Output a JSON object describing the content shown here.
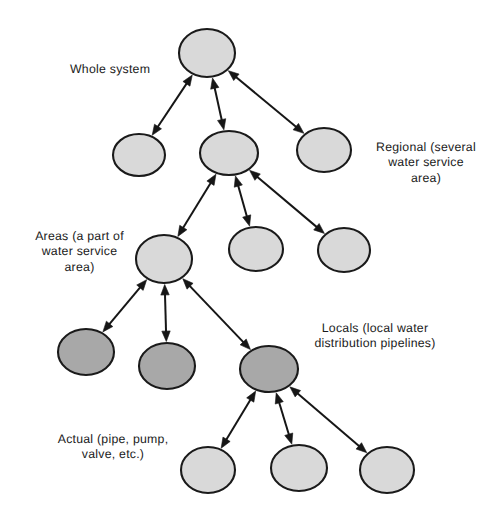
{
  "diagram": {
    "background_color": "#ffffff",
    "node_fill_light": "#d9d9d9",
    "node_fill_dark": "#a8a8a8",
    "node_stroke": "#1a1a1a",
    "edge_color": "#161616",
    "labels": [
      {
        "id": "whole-system",
        "text": "Whole system",
        "align": "left",
        "x": 70,
        "y": 62,
        "width": 100
      },
      {
        "id": "regional",
        "text": "Regional (several\nwater service\narea)",
        "align": "center",
        "x": 362,
        "y": 140,
        "width": 128
      },
      {
        "id": "areas",
        "text": "Areas (a part of\nwater service\narea)",
        "align": "center",
        "x": 17,
        "y": 229,
        "width": 125
      },
      {
        "id": "locals",
        "text": "Locals (local water\ndistribution pipelines)",
        "align": "center",
        "x": 297,
        "y": 321,
        "width": 156
      },
      {
        "id": "actual",
        "text": "Actual (pipe, pump,\nvalve, etc.)",
        "align": "center",
        "x": 37,
        "y": 432,
        "width": 152
      }
    ],
    "nodes": [
      {
        "id": "n-root",
        "level": 1,
        "shade": "light",
        "cx": 207,
        "cy": 53,
        "rx": 28,
        "ry": 24
      },
      {
        "id": "n-reg-left",
        "level": 2,
        "shade": "light",
        "cx": 139,
        "cy": 155,
        "rx": 26,
        "ry": 21
      },
      {
        "id": "n-reg-mid",
        "level": 2,
        "shade": "light",
        "cx": 229,
        "cy": 153,
        "rx": 29,
        "ry": 22
      },
      {
        "id": "n-reg-right",
        "level": 2,
        "shade": "light",
        "cx": 324,
        "cy": 150,
        "rx": 27,
        "ry": 22
      },
      {
        "id": "n-area-left",
        "level": 3,
        "shade": "light",
        "cx": 164,
        "cy": 259,
        "rx": 28,
        "ry": 24
      },
      {
        "id": "n-area-mid",
        "level": 3,
        "shade": "light",
        "cx": 256,
        "cy": 249,
        "rx": 27,
        "ry": 22
      },
      {
        "id": "n-area-right",
        "level": 3,
        "shade": "light",
        "cx": 344,
        "cy": 250,
        "rx": 26,
        "ry": 22
      },
      {
        "id": "n-local-1",
        "level": 4,
        "shade": "dark",
        "cx": 86,
        "cy": 352,
        "rx": 28,
        "ry": 23
      },
      {
        "id": "n-local-2",
        "level": 4,
        "shade": "dark",
        "cx": 167,
        "cy": 366,
        "rx": 28,
        "ry": 23
      },
      {
        "id": "n-local-3",
        "level": 4,
        "shade": "dark",
        "cx": 269,
        "cy": 369,
        "rx": 29,
        "ry": 23
      },
      {
        "id": "n-actual-1",
        "level": 5,
        "shade": "light",
        "cx": 208,
        "cy": 470,
        "rx": 27,
        "ry": 23
      },
      {
        "id": "n-actual-2",
        "level": 5,
        "shade": "light",
        "cx": 299,
        "cy": 468,
        "rx": 28,
        "ry": 23
      },
      {
        "id": "n-actual-3",
        "level": 5,
        "shade": "light",
        "cx": 387,
        "cy": 470,
        "rx": 27,
        "ry": 23
      }
    ],
    "edges": [
      {
        "id": "e-root-regleft",
        "from": "n-root",
        "to": "n-reg-left",
        "arrows": "both"
      },
      {
        "id": "e-root-regmid",
        "from": "n-root",
        "to": "n-reg-mid",
        "arrows": "both"
      },
      {
        "id": "e-root-regright",
        "from": "n-root",
        "to": "n-reg-right",
        "arrows": "both"
      },
      {
        "id": "e-regmid-arealeft",
        "from": "n-reg-mid",
        "to": "n-area-left",
        "arrows": "both"
      },
      {
        "id": "e-regmid-areamid",
        "from": "n-reg-mid",
        "to": "n-area-mid",
        "arrows": "both"
      },
      {
        "id": "e-regmid-arearight",
        "from": "n-reg-mid",
        "to": "n-area-right",
        "arrows": "both"
      },
      {
        "id": "e-arealeft-loc1",
        "from": "n-area-left",
        "to": "n-local-1",
        "arrows": "both"
      },
      {
        "id": "e-arealeft-loc2",
        "from": "n-area-left",
        "to": "n-local-2",
        "arrows": "both"
      },
      {
        "id": "e-arealeft-loc3",
        "from": "n-area-left",
        "to": "n-local-3",
        "arrows": "both"
      },
      {
        "id": "e-loc3-act1",
        "from": "n-local-3",
        "to": "n-actual-1",
        "arrows": "both"
      },
      {
        "id": "e-loc3-act2",
        "from": "n-local-3",
        "to": "n-actual-2",
        "arrows": "both"
      },
      {
        "id": "e-loc3-act3",
        "from": "n-local-3",
        "to": "n-actual-3",
        "arrows": "both"
      }
    ]
  }
}
